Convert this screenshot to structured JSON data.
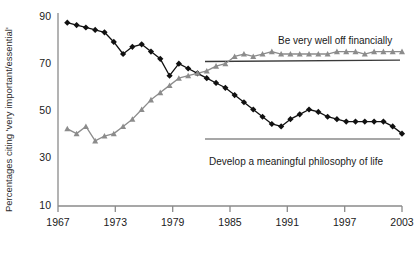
{
  "chart_data": {
    "type": "line",
    "title": "",
    "xlabel": "",
    "ylabel": "Percentages citing 'very important/essential'",
    "xlim": [
      1966,
      2003
    ],
    "ylim": [
      10,
      90
    ],
    "yticks": [
      10,
      30,
      50,
      70,
      90
    ],
    "ytick_labels": [
      "10",
      "30",
      "50",
      "70",
      "90"
    ],
    "xticks": [
      1967,
      1973,
      1979,
      1985,
      1991,
      1997,
      2003
    ],
    "xtick_labels": [
      "1967",
      "1973",
      "1979",
      "1985",
      "1991",
      "1997",
      "2003"
    ],
    "grid": false,
    "legend_position": "inline-annotation",
    "x": [
      1967,
      1968,
      1969,
      1970,
      1971,
      1972,
      1973,
      1974,
      1975,
      1976,
      1977,
      1978,
      1979,
      1980,
      1981,
      1982,
      1983,
      1984,
      1985,
      1986,
      1987,
      1988,
      1989,
      1990,
      1991,
      1992,
      1993,
      1994,
      1995,
      1996,
      1997,
      1998,
      1999,
      2000,
      2001,
      2002,
      2003
    ],
    "series": [
      {
        "name": "Develop a meaningful philosophy of life",
        "color": "#111111",
        "marker": "diamond",
        "values": [
          86,
          85,
          84,
          83,
          82,
          78,
          73,
          76,
          77,
          74,
          71,
          64,
          69,
          67,
          65,
          63,
          61,
          59,
          56,
          53,
          50,
          47,
          44,
          43,
          46,
          48,
          50,
          49,
          47,
          46,
          45,
          45,
          45,
          45,
          45,
          43,
          40
        ],
        "trend_line": {
          "x_start": 1983,
          "x_end": 2003,
          "y_start": 44,
          "y_end": 44,
          "color": "#7a7a7a"
        },
        "annotation": {
          "text": "Develop a meaningful philosophy of life",
          "x": 1992,
          "y": 33
        }
      },
      {
        "name": "Be very well off financially",
        "color": "#8c8c8c",
        "marker": "triangle",
        "values": [
          42,
          40,
          43,
          37,
          39,
          40,
          43,
          46,
          50,
          54,
          57,
          60,
          63,
          64,
          65,
          66,
          68,
          69,
          72,
          73,
          72,
          73,
          74,
          73,
          73,
          73,
          73,
          73,
          73,
          74,
          74,
          74,
          73,
          74,
          74,
          74,
          74
        ],
        "trend_line": {
          "x_start": 1983,
          "x_end": 2003,
          "y_start": 73,
          "y_end": 73.5,
          "color": "#3a3a3a"
        },
        "annotation": {
          "text": "Be very well off financially",
          "x": 1993,
          "y": 81
        }
      }
    ]
  },
  "axes": {
    "y_axis_title": "Percentages citing 'very important/essential'"
  },
  "annotations": {
    "financially_label": "Be very well off financially",
    "philosophy_label": "Develop a meaningful philosophy of life"
  },
  "footnote": {
    "text": ""
  }
}
